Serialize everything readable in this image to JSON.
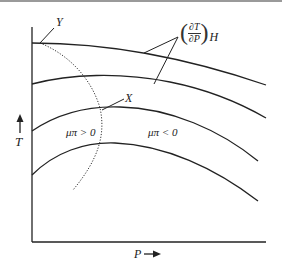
{
  "diagram": {
    "type": "joule-thomson inversion curve (isenthalps on T vs P)",
    "axes": {
      "y_label": "T",
      "x_label": "P",
      "y_arrow": "up-arrow",
      "x_arrow": "right-arrow"
    },
    "points": {
      "Y": "Y",
      "X": "X"
    },
    "slope_label": {
      "numerator": "∂T",
      "denominator": "∂P",
      "subscript": "H"
    },
    "regions": {
      "left": "μπ > 0",
      "right": "μπ < 0"
    },
    "curves": {
      "isenthalps": 4,
      "inversion_curve": "dotted"
    },
    "colors": {
      "line": "#222222",
      "top_border": "#9a9a9a",
      "background": "#ffffff"
    }
  }
}
